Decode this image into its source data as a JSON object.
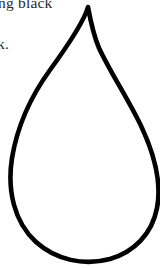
{
  "page": {
    "kind": "scanned-document-fragment",
    "background_color": "#ffffff",
    "width": 160,
    "height": 268
  },
  "text_fragments": {
    "line_1": "ng black",
    "line_2": "k.",
    "color": "#2a2a2a",
    "note_clipped": "clipped at top and left page margin"
  },
  "figure": {
    "name": "teardrop-outline",
    "stroke_color": "#000000",
    "fill_color": "none",
    "stroke_width": 4.6,
    "apex_x": 88,
    "apex_y": 7,
    "leftmost_x": 11,
    "rightmost_x": 158,
    "bottom_y": 263,
    "clipped_right_edge": true
  }
}
